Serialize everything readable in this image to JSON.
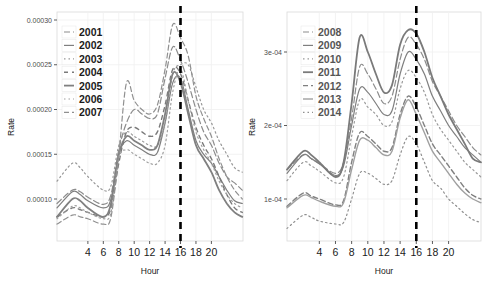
{
  "chart_data": [
    {
      "type": "line",
      "panel": "left",
      "title": "",
      "xlabel": "Hour",
      "ylabel": "Rate",
      "xlim": [
        0,
        24
      ],
      "ylim": [
        5.5e-05,
        0.00031
      ],
      "x_ticks": [
        4,
        6,
        8,
        10,
        12,
        14,
        16,
        18,
        20
      ],
      "x_tick_labels": [
        "4",
        "6",
        "8",
        "10",
        "12",
        "14",
        "16",
        "18",
        "20"
      ],
      "y_ticks": [
        0.0001,
        0.00015,
        0.0002,
        0.00025,
        0.0003
      ],
      "y_tick_labels": [
        "0.00010",
        "0.00015",
        "0.00020",
        "0.00025",
        "0.00030"
      ],
      "grid": true,
      "vline": {
        "x": 16,
        "style": "dashed",
        "color": "#000000"
      },
      "legend": {
        "position": "inside-top-left",
        "entries": [
          "2001",
          "2002",
          "2003",
          "2004",
          "2005",
          "2006",
          "2007"
        ]
      },
      "x": [
        0,
        2,
        3,
        4,
        6,
        7,
        8,
        9,
        10,
        11,
        12,
        13,
        14,
        15,
        16,
        17,
        18,
        19,
        20,
        21,
        22,
        23,
        24
      ],
      "series": [
        {
          "name": "2001",
          "dash": "6,3",
          "width": 1.2,
          "values": [
            9.5e-05,
            0.00011,
            0.000108,
            0.000102,
            9.4e-05,
            0.000105,
            0.000155,
            0.000185,
            0.0002,
            0.000195,
            0.00019,
            0.000195,
            0.000235,
            0.00027,
            0.000255,
            0.00023,
            0.0002,
            0.000175,
            0.00016,
            0.00014,
            0.000125,
            0.000118,
            0.00011
          ]
        },
        {
          "name": "2002",
          "dash": "none",
          "width": 1.2,
          "values": [
            9e-05,
            0.000108,
            0.000105,
            9.8e-05,
            9e-05,
            0.0001,
            0.00015,
            0.000165,
            0.00016,
            0.000155,
            0.00015,
            0.000152,
            0.000185,
            0.00023,
            0.000235,
            0.0002,
            0.000165,
            0.00015,
            0.00014,
            0.000125,
            0.00011,
            9.8e-05,
            9.5e-05
          ]
        },
        {
          "name": "2003",
          "dash": "1.5,3",
          "width": 1.2,
          "values": [
            0.00012,
            0.00014,
            0.000135,
            0.000125,
            0.00011,
            0.000115,
            0.00016,
            0.000175,
            0.00017,
            0.000165,
            0.00016,
            0.00016,
            0.000185,
            0.00024,
            0.00025,
            0.00025,
            0.000225,
            0.0002,
            0.000185,
            0.000165,
            0.00015,
            0.000135,
            0.00013
          ]
        },
        {
          "name": "2004",
          "dash": "4,4",
          "width": 1.4,
          "values": [
            8e-05,
            9e-05,
            8.8e-05,
            8.5e-05,
            8e-05,
            9e-05,
            0.00014,
            0.000175,
            0.00018,
            0.000175,
            0.00017,
            0.000175,
            0.000205,
            0.000245,
            0.00024,
            0.00021,
            0.00018,
            0.00016,
            0.000145,
            0.000125,
            0.000105,
            9e-05,
            8.5e-05
          ]
        },
        {
          "name": "2005",
          "dash": "none",
          "width": 1.8,
          "values": [
            8e-05,
            0.0001,
            9.8e-05,
            9e-05,
            8e-05,
            9.5e-05,
            0.00015,
            0.00017,
            0.000165,
            0.00016,
            0.000155,
            0.00016,
            0.000195,
            0.00024,
            0.00023,
            0.000195,
            0.00016,
            0.000145,
            0.00013,
            0.00011,
            9.5e-05,
            8.5e-05,
            8e-05
          ]
        },
        {
          "name": "2006",
          "dash": "1.5,3",
          "width": 1.2,
          "values": [
            7.8e-05,
            9.2e-05,
            9e-05,
            8.5e-05,
            7.8e-05,
            8.5e-05,
            0.000145,
            0.000155,
            0.00015,
            0.000145,
            0.00014,
            0.00014,
            0.00016,
            0.00022,
            0.000245,
            0.00021,
            0.000175,
            0.000155,
            0.00014,
            0.00012,
            0.000105,
            9.5e-05,
            9e-05
          ]
        },
        {
          "name": "2007",
          "dash": "5,3",
          "width": 1.2,
          "values": [
            7.2e-05,
            8.2e-05,
            8e-05,
            7.8e-05,
            7.2e-05,
            8e-05,
            0.00015,
            0.00023,
            0.00021,
            0.0002,
            0.000195,
            0.000205,
            0.000245,
            0.000295,
            0.00028,
            0.00026,
            0.000215,
            0.00019,
            0.00017,
            0.000145,
            0.000125,
            0.00011,
            0.0001
          ]
        }
      ]
    },
    {
      "type": "line",
      "panel": "right",
      "title": "",
      "xlabel": "Hour",
      "ylabel": "Rate",
      "xlim": [
        0,
        24
      ],
      "ylim": [
        4.3e-05,
        0.000353
      ],
      "x_ticks": [
        4,
        6,
        8,
        10,
        12,
        14,
        16,
        18,
        20
      ],
      "x_tick_labels": [
        "4",
        "6",
        "8",
        "10",
        "12",
        "14",
        "16",
        "18",
        "20"
      ],
      "y_ticks": [
        0.0001,
        0.0002,
        0.0003
      ],
      "y_tick_labels": [
        "1e-04",
        "2e-04",
        "3e-04"
      ],
      "grid": true,
      "vline": {
        "x": 16,
        "style": "dashed",
        "color": "#000000"
      },
      "legend": {
        "position": "inside-top-left",
        "entries": [
          "2008",
          "2009",
          "2010",
          "2011",
          "2012",
          "2013",
          "2014"
        ]
      },
      "x": [
        0,
        2,
        3,
        4,
        6,
        7,
        8,
        9,
        10,
        11,
        12,
        13,
        14,
        15,
        16,
        17,
        18,
        19,
        20,
        21,
        22,
        23,
        24
      ],
      "series": [
        {
          "name": "2008",
          "dash": "6,3",
          "width": 1.2,
          "values": [
            0.00014,
            0.00016,
            0.000155,
            0.000148,
            0.000135,
            0.00015,
            0.00021,
            0.00028,
            0.00027,
            0.00025,
            0.00023,
            0.00024,
            0.00029,
            0.00032,
            0.00031,
            0.00029,
            0.00026,
            0.00024,
            0.00022,
            0.0002,
            0.000185,
            0.00017,
            0.00016
          ]
        },
        {
          "name": "2009",
          "dash": "none",
          "width": 1.2,
          "values": [
            0.000135,
            0.00016,
            0.000155,
            0.000148,
            0.000132,
            0.000145,
            0.0002,
            0.00025,
            0.000245,
            0.00023,
            0.000215,
            0.00022,
            0.00027,
            0.0003,
            0.00029,
            0.00027,
            0.00024,
            0.00022,
            0.0002,
            0.000185,
            0.00017,
            0.00016,
            0.00015
          ]
        },
        {
          "name": "2010",
          "dash": "1.5,3",
          "width": 1.2,
          "values": [
            0.000125,
            0.00015,
            0.000145,
            0.000138,
            0.000122,
            0.00013,
            0.000185,
            0.000235,
            0.000225,
            0.000215,
            0.0002,
            0.000205,
            0.00025,
            0.000275,
            0.000265,
            0.000245,
            0.000215,
            0.000195,
            0.00018,
            0.000165,
            0.00015,
            0.00014,
            0.00013
          ]
        },
        {
          "name": "2011",
          "dash": "none",
          "width": 1.8,
          "values": [
            0.00014,
            0.000165,
            0.00016,
            0.00015,
            0.00013,
            0.00015,
            0.00023,
            0.00032,
            0.0003,
            0.00027,
            0.000245,
            0.000255,
            0.00031,
            0.00033,
            0.000325,
            0.0003,
            0.000265,
            0.00024,
            0.000215,
            0.000195,
            0.000175,
            0.000155,
            0.00015
          ]
        },
        {
          "name": "2012",
          "dash": "5,3",
          "width": 1.4,
          "values": [
            9e-05,
            0.000108,
            0.000104,
            0.0001,
            9.2e-05,
            9.8e-05,
            0.00015,
            0.00019,
            0.000185,
            0.000175,
            0.000165,
            0.00017,
            0.000215,
            0.00024,
            0.000225,
            0.0002,
            0.000175,
            0.00016,
            0.000145,
            0.00013,
            0.000115,
            0.000105,
            0.0001
          ]
        },
        {
          "name": "2013",
          "dash": "none",
          "width": 1.4,
          "values": [
            8.8e-05,
            0.000105,
            0.000102,
            9.7e-05,
            9e-05,
            9.5e-05,
            0.00014,
            0.00018,
            0.00018,
            0.00017,
            0.00016,
            0.000165,
            0.00021,
            0.000235,
            0.000215,
            0.00019,
            0.000165,
            0.00015,
            0.000135,
            0.00012,
            0.000108,
            0.0001,
            9.5e-05
          ]
        },
        {
          "name": "2014",
          "dash": "1.5,3",
          "width": 1.2,
          "values": [
            6e-05,
            7.8e-05,
            7.5e-05,
            7e-05,
            6.6e-05,
            6.8e-05,
            0.0001,
            0.000135,
            0.000135,
            0.000128,
            0.00012,
            0.000125,
            0.00016,
            0.000185,
            0.000175,
            0.00015,
            0.000125,
            0.000115,
            0.0001,
            9e-05,
            8e-05,
            7.2e-05,
            6.8e-05
          ]
        }
      ]
    }
  ]
}
